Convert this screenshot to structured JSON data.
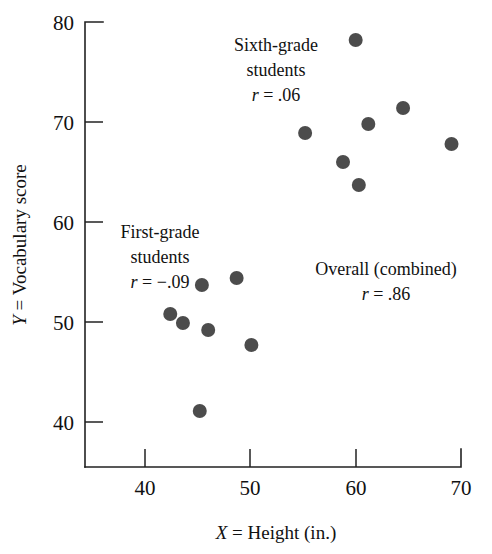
{
  "chart_data": {
    "type": "scatter",
    "title": "",
    "xlabel": "X = Height (in.)",
    "ylabel": "Y = Vocabulary score",
    "xlim": [
      35,
      71
    ],
    "ylim": [
      36,
      80
    ],
    "xticks": [
      40,
      50,
      60,
      70
    ],
    "yticks": [
      40,
      50,
      60,
      70,
      80
    ],
    "xtick_labels": [
      "40",
      "50",
      "60",
      "70"
    ],
    "ytick_labels": [
      "40",
      "50",
      "60",
      "70",
      "80"
    ],
    "grid": false,
    "legend": "none",
    "marker_color": "#4c4c4c",
    "axis_color": "#222222",
    "series": [
      {
        "name": "First-grade students",
        "r": -0.09,
        "points": [
          {
            "x": 42.4,
            "y": 50.8
          },
          {
            "x": 43.6,
            "y": 49.9
          },
          {
            "x": 45.4,
            "y": 53.7
          },
          {
            "x": 45.2,
            "y": 41.1
          },
          {
            "x": 46.0,
            "y": 49.2
          },
          {
            "x": 48.7,
            "y": 54.4
          },
          {
            "x": 50.1,
            "y": 47.7
          }
        ]
      },
      {
        "name": "Sixth-grade students",
        "r": 0.06,
        "points": [
          {
            "x": 55.2,
            "y": 68.9
          },
          {
            "x": 58.8,
            "y": 66.0
          },
          {
            "x": 60.0,
            "y": 78.2
          },
          {
            "x": 60.3,
            "y": 63.7
          },
          {
            "x": 61.2,
            "y": 69.8
          },
          {
            "x": 64.5,
            "y": 71.4
          },
          {
            "x": 69.1,
            "y": 67.8
          }
        ]
      }
    ],
    "annotations": [
      {
        "id": "sixth-grade",
        "lines": [
          "Sixth-grade",
          "students"
        ],
        "stat_symbol": "r",
        "stat_text": " = .06",
        "x": 57.0,
        "y": 77.5
      },
      {
        "id": "first-grade",
        "lines": [
          "First-grade",
          "students"
        ],
        "stat_symbol": "r",
        "stat_text": " = −.09",
        "x": 44.4,
        "y": 60.8
      },
      {
        "id": "overall-combined",
        "lines": [
          "Overall (combined)"
        ],
        "stat_symbol": "r",
        "stat_text": " = .86",
        "x": 62.8,
        "y": 55.4
      }
    ]
  },
  "axis_labels": {
    "x_symbol": "X",
    "x_rest": " = Height (in.)",
    "y_symbol": "Y",
    "y_rest": " = Vocabulary score"
  },
  "annotation_text": {
    "sixth_line1": "Sixth-grade",
    "sixth_line2": "students",
    "sixth_r_symbol": "r",
    "sixth_r_value": " = .06",
    "first_line1": "First-grade",
    "first_line2": "students",
    "first_r_symbol": "r",
    "first_r_value": " = −.09",
    "overall_line1": "Overall (combined)",
    "overall_r_symbol": "r",
    "overall_r_value": " = .86"
  },
  "ticks": {
    "y": [
      "80",
      "70",
      "60",
      "50",
      "40"
    ],
    "x": [
      "40",
      "50",
      "60",
      "70"
    ]
  }
}
